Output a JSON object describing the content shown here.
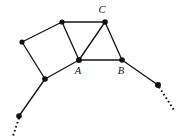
{
  "figure": {
    "background_color": "#ffffff",
    "stroke_color": "#161616",
    "node_color": "#111111",
    "canvas": {
      "width": 182,
      "height": 138
    }
  },
  "chart_data": {
    "type": "diagram",
    "diagram_kind": "undirected-graph",
    "title": "",
    "xlabel": "",
    "ylabel": "",
    "grid": false,
    "legend": null,
    "xlim": [
      0,
      182
    ],
    "ylim": [
      0,
      138
    ],
    "nodes": [
      {
        "id": "v_left",
        "label": "",
        "x": 22,
        "y": 42,
        "radius": 2.6,
        "labeled": false
      },
      {
        "id": "v_top",
        "label": "",
        "x": 62,
        "y": 22,
        "radius": 2.6,
        "labeled": false
      },
      {
        "id": "C",
        "label": "C",
        "x": 105,
        "y": 22,
        "radius": 2.8,
        "labeled": true,
        "label_x": 102,
        "label_y": 13
      },
      {
        "id": "A",
        "label": "A",
        "x": 79,
        "y": 60,
        "radius": 3.0,
        "labeled": true,
        "label_x": 78,
        "label_y": 74
      },
      {
        "id": "B",
        "label": "B",
        "x": 122,
        "y": 60,
        "radius": 2.8,
        "labeled": true,
        "label_x": 121,
        "label_y": 74
      },
      {
        "id": "v_bottomleft",
        "label": "",
        "x": 45,
        "y": 79,
        "radius": 2.8,
        "labeled": false
      },
      {
        "id": "v_tail_left",
        "label": "",
        "x": 19,
        "y": 116,
        "radius": 2.8,
        "labeled": false
      },
      {
        "id": "v_tail_right",
        "label": "",
        "x": 158,
        "y": 85,
        "radius": 3.0,
        "labeled": false
      }
    ],
    "edges": [
      {
        "from": "v_left",
        "to": "v_top",
        "style": "solid"
      },
      {
        "from": "v_top",
        "to": "A",
        "style": "solid"
      },
      {
        "from": "A",
        "to": "v_bottomleft",
        "style": "solid"
      },
      {
        "from": "v_bottomleft",
        "to": "v_left",
        "style": "solid"
      },
      {
        "from": "v_top",
        "to": "C",
        "style": "solid"
      },
      {
        "from": "C",
        "to": "A",
        "style": "solid"
      },
      {
        "from": "C",
        "to": "B",
        "style": "solid"
      },
      {
        "from": "A",
        "to": "B",
        "style": "solid"
      },
      {
        "from": "v_bottomleft",
        "to": "v_tail_left",
        "style": "solid"
      },
      {
        "from": "B",
        "to": "v_tail_right",
        "style": "solid"
      }
    ],
    "dotted_continuations": [
      {
        "id": "tail_left_dots",
        "from_x": 19,
        "from_y": 118,
        "to_x": 13,
        "to_y": 136
      },
      {
        "id": "tail_right_dots",
        "from_x": 159,
        "from_y": 87,
        "to_x": 174,
        "to_y": 110
      }
    ],
    "vertex_labels": [
      "A",
      "B",
      "C"
    ],
    "node_count": 8,
    "edge_count": 10
  }
}
